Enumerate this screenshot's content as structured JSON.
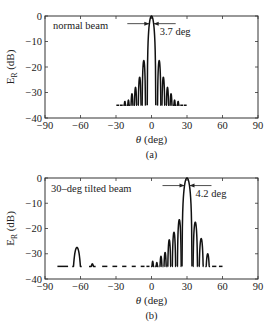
{
  "chart_data": [
    {
      "type": "line",
      "panel_label": "(a)",
      "annotation": "normal beam",
      "beamwidth_label": "3.7 deg",
      "beam_center": 0,
      "beamwidth": 3.7,
      "xlabel": "θ (deg)",
      "ylabel": "E_R (dB)",
      "xlim": [
        -90,
        90
      ],
      "ylim": [
        -40,
        0
      ],
      "xticks": [
        -90,
        -60,
        -30,
        0,
        30,
        60,
        90
      ],
      "yticks": [
        0,
        -10,
        -20,
        -30,
        -40
      ],
      "xtick_labels": [
        "−90",
        "−60",
        "−30",
        "0",
        "30",
        "60",
        "90"
      ],
      "ytick_labels": [
        "0",
        "−10",
        "−20",
        "−30",
        "−40"
      ],
      "grid": false,
      "lobes": [
        {
          "center": -28.5,
          "peak": -36.5,
          "half_width": 1.2
        },
        {
          "center": -25.5,
          "peak": -36,
          "half_width": 1.2
        },
        {
          "center": -22.5,
          "peak": -33.5,
          "half_width": 1.3
        },
        {
          "center": -19.5,
          "peak": -33,
          "half_width": 1.3
        },
        {
          "center": -16.5,
          "peak": -30.5,
          "half_width": 1.3
        },
        {
          "center": -13.5,
          "peak": -28,
          "half_width": 1.3
        },
        {
          "center": -10,
          "peak": -24,
          "half_width": 1.4
        },
        {
          "center": -6.5,
          "peak": -17.5,
          "half_width": 1.5
        },
        {
          "center": 0,
          "peak": 0,
          "half_width": 3.6
        },
        {
          "center": 6.5,
          "peak": -17.5,
          "half_width": 1.5
        },
        {
          "center": 10,
          "peak": -24,
          "half_width": 1.4
        },
        {
          "center": 13.5,
          "peak": -28,
          "half_width": 1.3
        },
        {
          "center": 16.5,
          "peak": -30.5,
          "half_width": 1.3
        },
        {
          "center": 19.5,
          "peak": -33,
          "half_width": 1.3
        },
        {
          "center": 22.5,
          "peak": -33.5,
          "half_width": 1.3
        },
        {
          "center": 25.5,
          "peak": -36,
          "half_width": 1.2
        },
        {
          "center": 28.5,
          "peak": -36.5,
          "half_width": 1.2
        }
      ]
    },
    {
      "type": "line",
      "panel_label": "(b)",
      "annotation": "30–deg tilted beam",
      "beamwidth_label": "4.2 deg",
      "beam_center": 30,
      "beamwidth": 4.2,
      "xlabel": "θ (deg)",
      "ylabel": "E_R (dB)",
      "xlim": [
        -90,
        90
      ],
      "ylim": [
        -40,
        0
      ],
      "xticks": [
        -90,
        -60,
        -30,
        0,
        30,
        60,
        90
      ],
      "yticks": [
        0,
        -10,
        -20,
        -30,
        -40
      ],
      "xtick_labels": [
        "−90",
        "−60",
        "−30",
        "0",
        "30",
        "60",
        "90"
      ],
      "ytick_labels": [
        "0",
        "−10",
        "−20",
        "−30",
        "−40"
      ],
      "grid": false,
      "lobes": [
        {
          "center": -75,
          "peak": -36.5,
          "half_width": 4.5
        },
        {
          "center": -63,
          "peak": -27.5,
          "half_width": 4.0
        },
        {
          "center": -50,
          "peak": -34,
          "half_width": 2.8
        },
        {
          "center": -39.5,
          "peak": -35.5,
          "half_width": 2.2
        },
        {
          "center": -31,
          "peak": -36,
          "half_width": 2.0
        },
        {
          "center": -23,
          "peak": -36.5,
          "half_width": 1.8
        },
        {
          "center": -15,
          "peak": -36,
          "half_width": 1.7
        },
        {
          "center": -7.5,
          "peak": -35,
          "half_width": 1.6
        },
        {
          "center": -3,
          "peak": -36,
          "half_width": 1.3
        },
        {
          "center": 1,
          "peak": -33,
          "half_width": 1.4
        },
        {
          "center": 4.5,
          "peak": -33.5,
          "half_width": 1.4
        },
        {
          "center": 8,
          "peak": -31,
          "half_width": 1.4
        },
        {
          "center": 11.5,
          "peak": -29.5,
          "half_width": 1.4
        },
        {
          "center": 15,
          "peak": -24.5,
          "half_width": 1.5
        },
        {
          "center": 19,
          "peak": -21.5,
          "half_width": 1.6
        },
        {
          "center": 23.5,
          "peak": -16.5,
          "half_width": 1.7
        },
        {
          "center": 30,
          "peak": 0,
          "half_width": 4.2
        },
        {
          "center": 37,
          "peak": -17.5,
          "half_width": 2.0
        },
        {
          "center": 42,
          "peak": -24,
          "half_width": 2.0
        },
        {
          "center": 47.5,
          "peak": -30,
          "half_width": 2.0
        },
        {
          "center": 53,
          "peak": -35,
          "half_width": 1.8
        },
        {
          "center": 58.5,
          "peak": -36.5,
          "half_width": 1.5
        }
      ]
    }
  ]
}
